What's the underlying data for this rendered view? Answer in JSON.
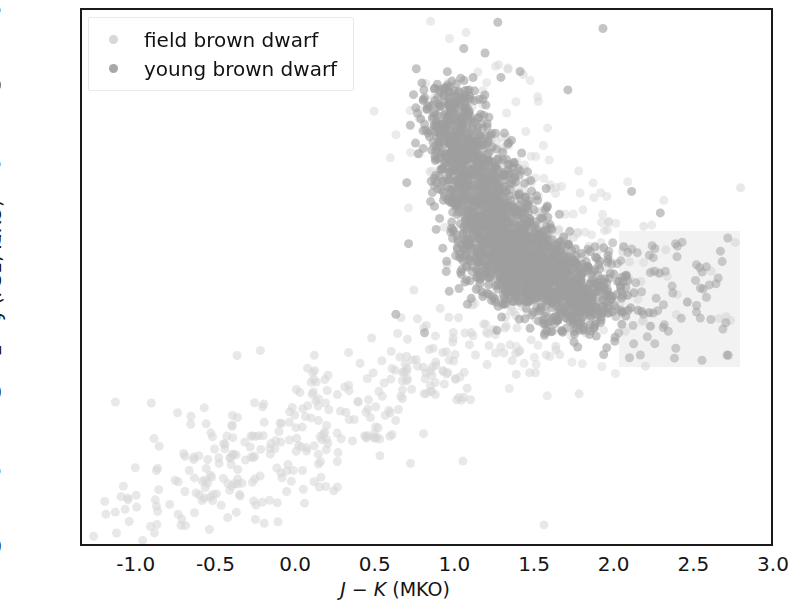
{
  "figure": {
    "background": "#ffffff",
    "axis_color": "#1a1a1a"
  },
  "axes": {
    "x_title_parts": {
      "v1": "J",
      "minus": " − ",
      "v2": "K",
      "unit": " (MKO)"
    },
    "y_title_parts": {
      "v1": "z",
      "minus": " − ",
      "v2": "J",
      "unit": " (PS1, MKO)"
    },
    "x_ticks": [
      "-1.0",
      "-0.5",
      "0.0",
      "0.5",
      "1.0",
      "1.5",
      "2.0",
      "2.5",
      "3.0"
    ],
    "y_ticks": [
      "1.5",
      "2.0",
      "2.5",
      "3.0",
      "3.5",
      "4.0",
      "4.5",
      "5.0"
    ]
  },
  "legend": {
    "position": "upper-left",
    "entries": [
      {
        "label": "field brown dwarf",
        "color": "#d8d8d8"
      },
      {
        "label": "young brown dwarf",
        "color": "#a8a8a8"
      }
    ]
  },
  "annotations": {
    "shaded_region": {
      "name": "selection-region",
      "color": "#f2f2f2",
      "x_range": [
        2.02,
        2.78
      ],
      "y_range": [
        2.94,
        3.82
      ]
    }
  },
  "chart_data": {
    "type": "scatter",
    "title": "",
    "xlabel": "J − K (MKO)",
    "ylabel": "z − J (PS1, MKO)",
    "xlim": [
      -1.35,
      3.0
    ],
    "ylim_inverted": [
      1.5,
      5.0
    ],
    "grid": false,
    "legend_position": "upper left",
    "marker": "circle",
    "marker_size_px": 9,
    "series": [
      {
        "name": "field brown dwarf",
        "color": "#d6d6d6",
        "alpha": 0.55,
        "n_points": 420,
        "description": "Sparse light-gray sequence running diagonally from lower-left (J-K ~ -1.2, z-J ~ 4.8) up to the right toward (J-K ~ 1.0, z-J ~ 3.6), plus a light halo surrounding the dense young-dwarf clump and extending right into the shaded box.",
        "clusters": [
          {
            "cx": -1.05,
            "cy": 4.72,
            "sx": 0.14,
            "sy": 0.16,
            "n": 18
          },
          {
            "cx": -0.62,
            "cy": 4.55,
            "sx": 0.18,
            "sy": 0.2,
            "n": 46
          },
          {
            "cx": -0.3,
            "cy": 4.42,
            "sx": 0.2,
            "sy": 0.22,
            "n": 62
          },
          {
            "cx": 0.02,
            "cy": 4.26,
            "sx": 0.2,
            "sy": 0.22,
            "n": 58
          },
          {
            "cx": 0.35,
            "cy": 4.1,
            "sx": 0.2,
            "sy": 0.18,
            "n": 52
          },
          {
            "cx": 0.68,
            "cy": 3.93,
            "sx": 0.18,
            "sy": 0.16,
            "n": 44
          },
          {
            "cx": 0.95,
            "cy": 3.76,
            "sx": 0.16,
            "sy": 0.16,
            "n": 38
          },
          {
            "cx": 1.2,
            "cy": 3.45,
            "sx": 0.22,
            "sy": 0.3,
            "n": 46
          },
          {
            "cx": 1.6,
            "cy": 3.3,
            "sx": 0.26,
            "sy": 0.28,
            "n": 34
          },
          {
            "cx": 2.15,
            "cy": 3.35,
            "sx": 0.3,
            "sy": 0.26,
            "n": 22
          }
        ],
        "outliers": [
          [
            -1.2,
            4.78
          ],
          [
            -1.14,
            4.05
          ],
          [
            -0.92,
            4.86
          ],
          [
            -0.75,
            4.12
          ],
          [
            -0.55,
            4.88
          ],
          [
            -0.12,
            4.83
          ],
          [
            0.18,
            4.6
          ],
          [
            0.52,
            4.4
          ],
          [
            2.6,
            3.2
          ],
          [
            2.72,
            3.52
          ],
          [
            1.42,
            1.92
          ],
          [
            1.55,
            4.85
          ]
        ]
      },
      {
        "name": "young brown dwarf",
        "color": "#9e9e9e",
        "alpha": 0.6,
        "n_points": 2400,
        "description": "Dense overlapping clump forming an elongated ridge from (J-K ~ 0.9, z-J ~ 2.05) sloping down-right to (J-K ~ 1.9, z-J ~ 3.45); core saturation around J-K 1.1-1.6, z-J 2.8-3.4.",
        "ridge": [
          {
            "cx": 0.95,
            "cy": 2.12,
            "sx": 0.1,
            "sy": 0.12,
            "n": 120
          },
          {
            "cx": 1.02,
            "cy": 2.32,
            "sx": 0.11,
            "sy": 0.13,
            "n": 170
          },
          {
            "cx": 1.08,
            "cy": 2.52,
            "sx": 0.12,
            "sy": 0.13,
            "n": 210
          },
          {
            "cx": 1.15,
            "cy": 2.72,
            "sx": 0.13,
            "sy": 0.13,
            "n": 250
          },
          {
            "cx": 1.25,
            "cy": 2.92,
            "sx": 0.14,
            "sy": 0.13,
            "n": 290
          },
          {
            "cx": 1.36,
            "cy": 3.06,
            "sx": 0.16,
            "sy": 0.12,
            "n": 320
          },
          {
            "cx": 1.48,
            "cy": 3.18,
            "sx": 0.17,
            "sy": 0.12,
            "n": 300
          },
          {
            "cx": 1.6,
            "cy": 3.28,
            "sx": 0.17,
            "sy": 0.12,
            "n": 250
          },
          {
            "cx": 1.72,
            "cy": 3.36,
            "sx": 0.16,
            "sy": 0.12,
            "n": 180
          },
          {
            "cx": 1.84,
            "cy": 3.42,
            "sx": 0.15,
            "sy": 0.12,
            "n": 110
          }
        ],
        "outliers": [
          [
            1.26,
            1.58
          ],
          [
            1.92,
            1.62
          ],
          [
            1.4,
            1.9
          ],
          [
            1.18,
            1.78
          ],
          [
            1.7,
            2.02
          ],
          [
            2.1,
            2.68
          ],
          [
            2.28,
            2.82
          ],
          [
            2.05,
            3.04
          ],
          [
            0.7,
            3.02
          ],
          [
            0.62,
            3.48
          ],
          [
            0.8,
            3.6
          ],
          [
            2.45,
            3.4
          ]
        ]
      }
    ]
  }
}
